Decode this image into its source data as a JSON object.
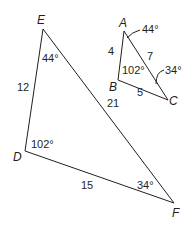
{
  "diagram": {
    "large_triangle": {
      "vertices": {
        "E": "E",
        "D": "D",
        "F": "F"
      },
      "sides": {
        "ED": "12",
        "EF": "21",
        "DF": "15"
      },
      "angles": {
        "E": "44°",
        "D": "102°",
        "F": "34°"
      }
    },
    "small_triangle": {
      "vertices": {
        "A": "A",
        "B": "B",
        "C": "C"
      },
      "sides": {
        "AB": "4",
        "AC": "7",
        "BC": "5"
      },
      "angles": {
        "A": "44°",
        "B": "102°",
        "C": "34°"
      }
    },
    "colors": {
      "stroke": "#231f20",
      "background": "#ffffff"
    }
  }
}
